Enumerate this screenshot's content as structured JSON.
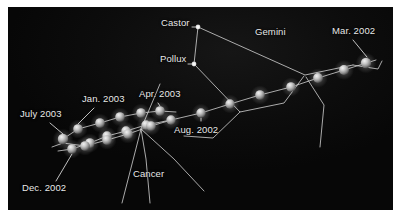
{
  "figure": {
    "title_visible": false,
    "background_color": "#0a0a0a",
    "frame_color": "#ffffff",
    "line_color": "#d8d8d8",
    "planet_color": "#c9c9c9",
    "star_color": "#ffffff",
    "label_color": "#e9e9e9"
  },
  "labels": {
    "castor": "Castor",
    "pollux": "Pollux",
    "gemini": "Gemini",
    "cancer": "Cancer",
    "mar_2002": "Mar. 2002",
    "aug_2002": "Aug. 2002",
    "dec_2002": "Dec. 2002",
    "jan_2003": "Jan. 2003",
    "apr_2003": "Apr. 2003",
    "july_2003": "July 2003"
  },
  "chart_data": {
    "type": "scatter",
    "xlabel": "",
    "ylabel": "",
    "xlim": [
      0,
      385
    ],
    "ylim": [
      0,
      203
    ],
    "grid": false,
    "legend": "none",
    "annotations": [
      {
        "name": "castor-label",
        "text": "Castor",
        "x": 182,
        "y": 17,
        "anchor": "end"
      },
      {
        "name": "pollux-label",
        "text": "Pollux",
        "x": 178,
        "y": 53,
        "anchor": "end"
      },
      {
        "name": "gemini-label",
        "text": "Gemini",
        "x": 262,
        "y": 26,
        "anchor": "middle"
      },
      {
        "name": "cancer-label",
        "text": "Cancer",
        "x": 140,
        "y": 168,
        "anchor": "middle"
      },
      {
        "name": "mar-2002-label",
        "text": "Mar. 2002",
        "x": 345,
        "y": 25,
        "anchor": "middle"
      },
      {
        "name": "aug-2002-label",
        "text": "Aug. 2002",
        "x": 188,
        "y": 124,
        "anchor": "middle"
      },
      {
        "name": "dec-2002-label",
        "text": "Dec. 2002",
        "x": 36,
        "y": 182,
        "anchor": "middle"
      },
      {
        "name": "jan-2003-label",
        "text": "Jan. 2003",
        "x": 95,
        "y": 93,
        "anchor": "middle"
      },
      {
        "name": "apr-2003-label",
        "text": "Apr. 2003",
        "x": 152,
        "y": 88,
        "anchor": "middle"
      },
      {
        "name": "july-2003-label",
        "text": "July 2003",
        "x": 33,
        "y": 108,
        "anchor": "middle"
      }
    ],
    "series": [
      {
        "name": "planet-positions",
        "marker": "sphere",
        "points": [
          {
            "x": 358,
            "y": 56,
            "r": 5.2,
            "label": "Mar. 2002"
          },
          {
            "x": 336,
            "y": 63,
            "r": 5.0
          },
          {
            "x": 310,
            "y": 71,
            "r": 4.9
          },
          {
            "x": 283,
            "y": 80,
            "r": 4.8
          },
          {
            "x": 252,
            "y": 88,
            "r": 4.8
          },
          {
            "x": 222,
            "y": 97,
            "r": 4.7
          },
          {
            "x": 193,
            "y": 106,
            "r": 4.7,
            "label": "Aug. 2002"
          },
          {
            "x": 163,
            "y": 113,
            "r": 4.7
          },
          {
            "x": 138,
            "y": 118,
            "r": 4.7
          },
          {
            "x": 118,
            "y": 124,
            "r": 4.7
          },
          {
            "x": 99,
            "y": 129,
            "r": 4.7
          },
          {
            "x": 82,
            "y": 136,
            "r": 4.8
          },
          {
            "x": 64,
            "y": 142,
            "r": 4.8,
            "label": "Dec. 2002"
          },
          {
            "x": 70,
            "y": 122,
            "r": 4.8,
            "label": "Jan. 2003"
          },
          {
            "x": 92,
            "y": 116,
            "r": 4.8
          },
          {
            "x": 112,
            "y": 110,
            "r": 4.8
          },
          {
            "x": 133,
            "y": 106,
            "r": 4.8
          },
          {
            "x": 152,
            "y": 104,
            "r": 4.8,
            "label": "Apr. 2003"
          },
          {
            "x": 143,
            "y": 119,
            "r": 4.8
          },
          {
            "x": 120,
            "y": 127,
            "r": 4.8
          },
          {
            "x": 99,
            "y": 133,
            "r": 4.8
          },
          {
            "x": 77,
            "y": 139,
            "r": 4.8
          },
          {
            "x": 55,
            "y": 132,
            "r": 5.2,
            "label": "July 2003"
          }
        ]
      },
      {
        "name": "bright-stars",
        "marker": "point",
        "points": [
          {
            "x": 190,
            "y": 20,
            "r": 2.4,
            "label": "Castor"
          },
          {
            "x": 186,
            "y": 57,
            "r": 2.4,
            "label": "Pollux"
          }
        ]
      }
    ],
    "paths": [
      {
        "name": "ecliptic-track",
        "kind": "planet-path",
        "points": [
          [
            368,
            53
          ],
          [
            336,
            63
          ],
          [
            310,
            71
          ],
          [
            283,
            80
          ],
          [
            252,
            88
          ],
          [
            222,
            97
          ],
          [
            193,
            106
          ],
          [
            163,
            113
          ],
          [
            138,
            118
          ],
          [
            118,
            124
          ],
          [
            99,
            129
          ],
          [
            82,
            136
          ],
          [
            64,
            142
          ],
          [
            50,
            144
          ]
        ]
      },
      {
        "name": "retrograde-upper",
        "kind": "planet-path",
        "points": [
          [
            55,
            132
          ],
          [
            70,
            122
          ],
          [
            92,
            116
          ],
          [
            112,
            110
          ],
          [
            133,
            106
          ],
          [
            152,
            104
          ],
          [
            168,
            105
          ]
        ]
      },
      {
        "name": "retrograde-lower",
        "kind": "planet-path",
        "points": [
          [
            44,
            140
          ],
          [
            55,
            136
          ],
          [
            77,
            139
          ],
          [
            99,
            133
          ],
          [
            120,
            127
          ],
          [
            143,
            119
          ],
          [
            160,
            114
          ]
        ]
      },
      {
        "name": "gemini-line-castor-pollux",
        "kind": "constellation",
        "points": [
          [
            190,
            20
          ],
          [
            186,
            57
          ]
        ]
      },
      {
        "name": "gemini-line-castor-east",
        "kind": "constellation",
        "points": [
          [
            190,
            20
          ],
          [
            297,
            68
          ],
          [
            345,
            58
          ]
        ]
      },
      {
        "name": "gemini-line-east-hook",
        "kind": "constellation",
        "points": [
          [
            345,
            58
          ],
          [
            370,
            62
          ],
          [
            374,
            54
          ]
        ]
      },
      {
        "name": "gemini-line-pollux-south",
        "kind": "constellation",
        "points": [
          [
            186,
            57
          ],
          [
            232,
            105
          ],
          [
            276,
            96
          ],
          [
            296,
            69
          ]
        ]
      },
      {
        "name": "gemini-line-south-branch",
        "kind": "constellation",
        "points": [
          [
            232,
            105
          ],
          [
            205,
            131
          ],
          [
            176,
            129
          ]
        ]
      },
      {
        "name": "gemini-line-east-down",
        "kind": "constellation",
        "points": [
          [
            298,
            70
          ],
          [
            316,
            98
          ],
          [
            312,
            140
          ]
        ]
      },
      {
        "name": "cancer-line-left",
        "kind": "constellation",
        "points": [
          [
            152,
            77
          ],
          [
            133,
            122
          ],
          [
            114,
            196
          ]
        ]
      },
      {
        "name": "cancer-line-down",
        "kind": "constellation",
        "points": [
          [
            133,
            122
          ],
          [
            138,
            152
          ],
          [
            142,
            196
          ]
        ]
      },
      {
        "name": "cancer-line-right",
        "kind": "constellation",
        "points": [
          [
            133,
            122
          ],
          [
            166,
            152
          ],
          [
            196,
            184
          ]
        ]
      }
    ],
    "leaders": [
      {
        "name": "mar-2002-leader",
        "from": [
          345,
          33
        ],
        "to": [
          359,
          50
        ]
      },
      {
        "name": "aug-2002-leader",
        "from": [
          193,
          114
        ],
        "to": [
          193,
          111
        ]
      },
      {
        "name": "dec-2002-leader",
        "from": [
          48,
          174
        ],
        "to": [
          64,
          147
        ]
      },
      {
        "name": "jan-2003-leader",
        "from": [
          86,
          101
        ],
        "to": [
          70,
          117
        ]
      },
      {
        "name": "apr-2003-leader",
        "from": [
          150,
          96
        ],
        "to": [
          152,
          99
        ]
      },
      {
        "name": "july-2003-leader",
        "from": [
          42,
          116
        ],
        "to": [
          55,
          127
        ]
      },
      {
        "name": "castor-leader",
        "from": [
          184,
          20
        ],
        "to": [
          188,
          20
        ]
      },
      {
        "name": "pollux-leader",
        "from": [
          180,
          57
        ],
        "to": [
          184,
          57
        ]
      }
    ]
  }
}
